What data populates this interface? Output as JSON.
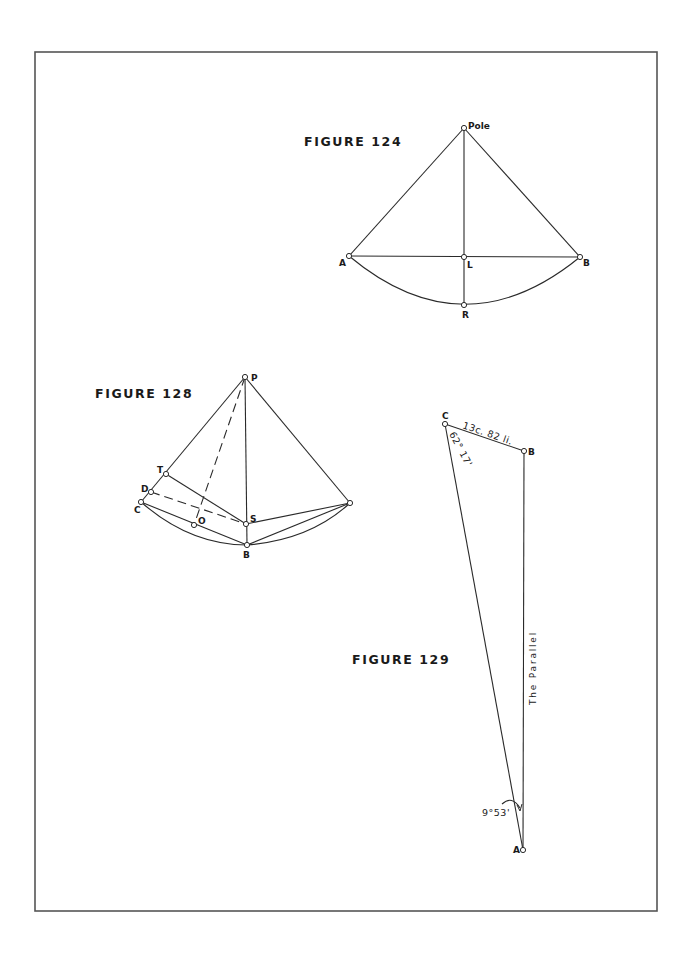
{
  "figures": [
    {
      "id": "fig124",
      "title": "FIGURE 124",
      "labels": {
        "pole": "Pole",
        "a": "A",
        "l": "L",
        "b": "B",
        "r": "R"
      }
    },
    {
      "id": "fig128",
      "title": "FIGURE 128",
      "labels": {
        "p": "P",
        "t": "T",
        "d": "D",
        "c": "C",
        "o": "O",
        "s": "S",
        "b": "B"
      }
    },
    {
      "id": "fig129",
      "title": "FIGURE 129",
      "labels": {
        "c": "C",
        "b": "B",
        "a": "A",
        "distance": "13c. 82 li.",
        "angle_c": "62° 17'",
        "angle_a": "9°53'",
        "parallel": "The Parallel"
      }
    }
  ],
  "colors": {
    "ink": "#2a2a2a",
    "border": "#555555",
    "paper": "#ffffff"
  }
}
